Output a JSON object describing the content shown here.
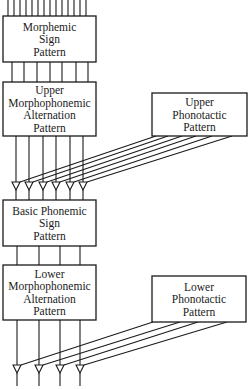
{
  "diagram": {
    "colors": {
      "line": "#1a1a1a",
      "background": "#ffffff"
    },
    "boxes": [
      {
        "id": "morphemic-sign-pattern",
        "x": 3,
        "y": 16,
        "w": 93,
        "h": 46,
        "lines": [
          "Morphemic",
          "Sign",
          "Pattern"
        ]
      },
      {
        "id": "upper-morphophonemic-alternation-pattern",
        "x": 3,
        "y": 82,
        "w": 93,
        "h": 54,
        "lines": [
          "Upper",
          "Morphophonemic",
          "Alternation",
          "Pattern"
        ]
      },
      {
        "id": "upper-phonotactic-pattern",
        "x": 152,
        "y": 93,
        "w": 95,
        "h": 43,
        "lines": [
          "Upper",
          "Phonotactic",
          "Pattern"
        ]
      },
      {
        "id": "basic-phonemic-sign-pattern",
        "x": 3,
        "y": 200,
        "w": 93,
        "h": 46,
        "lines": [
          "Basic Phonemic",
          "Sign",
          "Pattern"
        ]
      },
      {
        "id": "lower-morphophonemic-alternation-pattern",
        "x": 3,
        "y": 265,
        "w": 93,
        "h": 55,
        "lines": [
          "Lower",
          "Morphophonemic",
          "Alternation",
          "Pattern"
        ]
      },
      {
        "id": "lower-phonotactic-pattern",
        "x": 152,
        "y": 276,
        "w": 94,
        "h": 46,
        "lines": [
          "Lower",
          "Phonotactic",
          "Pattern"
        ]
      }
    ],
    "input_lines": {
      "xs": [
        8,
        14,
        20,
        26,
        32,
        38,
        44,
        50,
        56,
        62,
        68,
        74,
        80,
        86
      ],
      "y1": 0,
      "y2": 16
    },
    "connector_1": {
      "xs": [
        12,
        24,
        37,
        50,
        62,
        76,
        88
      ],
      "y1": 62,
      "y2": 82
    },
    "connector_2": {
      "xs": [
        16,
        29,
        43,
        56,
        70,
        83
      ],
      "y1": 136,
      "y2": 182
    },
    "junctions_upper": {
      "xs": [
        16,
        29,
        43,
        56,
        70,
        83
      ],
      "y": 182,
      "size": 8,
      "out_y2": 200
    },
    "fan_upper": {
      "from": [
        [
          156,
          136
        ],
        [
          168,
          136
        ],
        [
          182,
          136
        ],
        [
          196,
          136
        ],
        [
          212,
          136
        ],
        [
          232,
          136
        ]
      ],
      "to": [
        [
          20,
          182
        ],
        [
          33,
          182
        ],
        [
          47,
          182
        ],
        [
          60,
          182
        ],
        [
          74,
          182
        ],
        [
          87,
          182
        ]
      ]
    },
    "connector_3": {
      "xs": [
        17,
        39,
        60,
        80
      ],
      "y1": 246,
      "y2": 265
    },
    "connector_4": {
      "xs": [
        17,
        39,
        60,
        80
      ],
      "y1": 320,
      "y2": 365
    },
    "junctions_lower": {
      "xs": [
        17,
        39,
        60,
        80
      ],
      "y": 365,
      "size": 8,
      "out_y2": 386
    },
    "fan_lower": {
      "from": [
        [
          153,
          322
        ],
        [
          180,
          322
        ],
        [
          198,
          322
        ],
        [
          227,
          322
        ]
      ],
      "to": [
        [
          21,
          365
        ],
        [
          43,
          365
        ],
        [
          64,
          365
        ],
        [
          84,
          365
        ]
      ]
    }
  }
}
